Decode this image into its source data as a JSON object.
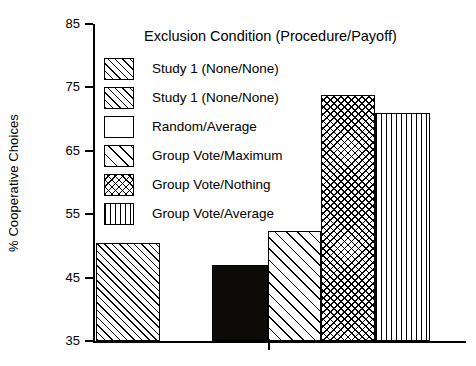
{
  "chart_data": {
    "type": "bar",
    "title": "",
    "legend_title": "Exclusion Condition (Procedure/Payoff)",
    "xlabel": "",
    "ylabel": "% Cooperative Choices",
    "ylim": [
      35,
      85
    ],
    "yticks": [
      35,
      45,
      55,
      65,
      75,
      85
    ],
    "grid": false,
    "legend_position": "inside-top-center",
    "categories": [
      "Study 1 (None/None)",
      "Random/Average",
      "Group Vote/Maximum",
      "Group Vote/Nothing",
      "Group Vote/Average"
    ],
    "values": [
      50.5,
      47.0,
      52.3,
      73.8,
      71.0
    ],
    "series": [
      {
        "name": "% Cooperative Choices",
        "values": [
          50.5,
          47.0,
          52.3,
          73.8,
          71.0
        ]
      }
    ],
    "bars": [
      {
        "label": "Study 1 (None/None)",
        "value": 50.5,
        "pattern": "diag-dense",
        "x": 96,
        "width": 64
      },
      {
        "label": "Random/Average",
        "value": 47.0,
        "pattern": "solid",
        "x": 212,
        "width": 56
      },
      {
        "label": "Group Vote/Maximum",
        "value": 52.3,
        "pattern": "diag-sparse",
        "x": 268,
        "width": 53
      },
      {
        "label": "Group Vote/Nothing",
        "value": 73.8,
        "pattern": "crosshatch",
        "x": 321,
        "width": 54
      },
      {
        "label": "Group Vote/Average",
        "value": 71.0,
        "pattern": "vertical",
        "x": 375,
        "width": 55
      }
    ],
    "legend_entries": [
      {
        "label": "Study 1 (None/None)",
        "pattern": "diag-dense"
      },
      {
        "label": "Study 1 (None/None)",
        "pattern": "diag-dense"
      },
      {
        "label": "Random/Average",
        "pattern": "solid"
      },
      {
        "label": "Group Vote/Maximum",
        "pattern": "diag-sparse"
      },
      {
        "label": "Group Vote/Nothing",
        "pattern": "crosshatch"
      },
      {
        "label": "Group Vote/Average",
        "pattern": "vertical"
      }
    ],
    "colors": {
      "foreground": "#000000",
      "background": "#ffffff",
      "solid_fill": "#0d0b08"
    }
  }
}
